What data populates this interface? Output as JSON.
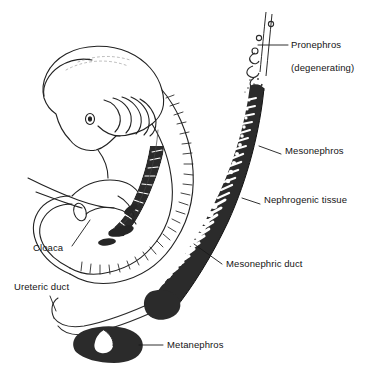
{
  "figure": {
    "type": "anatomical-line-diagram",
    "background_color": "#ffffff",
    "ink_color": "#1f1f1f",
    "fill_color": "#2b2b2b",
    "labels": [
      {
        "id": "pronephros",
        "text": "Pronephros\n(degenerating)",
        "line1": "Pronephros",
        "line2": "(degenerating)",
        "x": 291,
        "y": 33,
        "leader": {
          "x1": 288,
          "y1": 45,
          "x2": 258,
          "y2": 45
        }
      },
      {
        "id": "mesonephros",
        "text": "Mesonephros",
        "x": 285,
        "y": 150,
        "leader": {
          "x1": 281,
          "y1": 155,
          "x2": 258,
          "y2": 148
        }
      },
      {
        "id": "nephrogenic-tissue",
        "text": "Nephrogenic tissue",
        "x": 264,
        "y": 199,
        "leader": {
          "x1": 260,
          "y1": 205,
          "x2": 243,
          "y2": 199
        }
      },
      {
        "id": "mesonephric-duct",
        "text": "Mesonephric duct",
        "x": 226,
        "y": 260,
        "leader": {
          "x1": 223,
          "y1": 265,
          "x2": 196,
          "y2": 246
        }
      },
      {
        "id": "cloaca",
        "text": "Cloaca",
        "x": 41,
        "y": 248,
        "leader": {
          "x1": 70,
          "y1": 248,
          "x2": 88,
          "y2": 222
        }
      },
      {
        "id": "ureteric-duct",
        "text": "Ureteric duct",
        "x": 16,
        "y": 285,
        "leader": {
          "x1": 49,
          "y1": 297,
          "x2": 55,
          "y2": 312
        }
      },
      {
        "id": "metanephros",
        "text": "Metanephros",
        "x": 167,
        "y": 341,
        "leader": {
          "x1": 163,
          "y1": 346,
          "x2": 140,
          "y2": 346
        }
      }
    ],
    "structures": [
      {
        "id": "embryo-body",
        "name": "embryo outline"
      },
      {
        "id": "embryo-head",
        "name": "embryo head"
      },
      {
        "id": "pharyngeal-arches",
        "name": "pharyngeal arches"
      },
      {
        "id": "somites",
        "name": "somites along back"
      },
      {
        "id": "tail",
        "name": "embryo tail"
      },
      {
        "id": "cloaca-region",
        "name": "cloaca"
      },
      {
        "id": "enlarged-pronephros",
        "name": "degenerating pronephros vesicles"
      },
      {
        "id": "enlarged-mesonephros",
        "name": "mesonephros with tubules"
      },
      {
        "id": "enlarged-duct",
        "name": "mesonephric duct"
      },
      {
        "id": "enlarged-metanephros",
        "name": "metanephros"
      },
      {
        "id": "enlarged-ureteric-duct",
        "name": "ureteric duct"
      }
    ]
  }
}
